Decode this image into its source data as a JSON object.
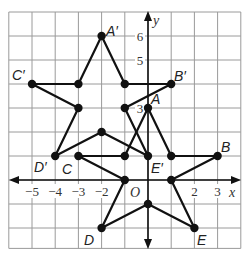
{
  "figure": {
    "grid": {
      "xmin": -6,
      "xmax": 4,
      "ymin": -2.85,
      "ymax": 7
    },
    "axes": {
      "x_label": "x",
      "y_label": "y",
      "origin_label": "O",
      "x_ticks": [
        {
          "value": -5,
          "label": "−5"
        },
        {
          "value": -4,
          "label": "−4"
        },
        {
          "value": -3,
          "label": "−3"
        },
        {
          "value": -2,
          "label": "−2"
        },
        {
          "value": 2,
          "label": "2"
        },
        {
          "value": 3,
          "label": "3"
        }
      ],
      "y_ticks": [
        {
          "value": 6,
          "label": "6"
        },
        {
          "value": 5,
          "label": "5"
        },
        {
          "value": 3,
          "label": "3"
        }
      ]
    },
    "original_star": {
      "name": "ABCDE",
      "vertices": [
        {
          "label": "A",
          "x": 0,
          "y": 3
        },
        {
          "label": "",
          "x": 1,
          "y": 1
        },
        {
          "label": "B",
          "x": 3,
          "y": 1
        },
        {
          "label": "",
          "x": 1,
          "y": 0
        },
        {
          "label": "E",
          "x": 2,
          "y": -2
        },
        {
          "label": "",
          "x": 0,
          "y": -1
        },
        {
          "label": "D",
          "x": -2,
          "y": -2
        },
        {
          "label": "",
          "x": -1,
          "y": 0
        },
        {
          "label": "C",
          "x": -3,
          "y": 1
        },
        {
          "label": "",
          "x": -1,
          "y": 1
        }
      ]
    },
    "image_star": {
      "name": "A'B'C'D'E'",
      "vertices": [
        {
          "label": "A′",
          "x": -2,
          "y": 6
        },
        {
          "label": "",
          "x": -1,
          "y": 4
        },
        {
          "label": "B′",
          "x": 1,
          "y": 4
        },
        {
          "label": "",
          "x": -1,
          "y": 3
        },
        {
          "label": "E′",
          "x": 0,
          "y": 1
        },
        {
          "label": "",
          "x": -2,
          "y": 2
        },
        {
          "label": "D′",
          "x": -4,
          "y": 1
        },
        {
          "label": "",
          "x": -3,
          "y": 3
        },
        {
          "label": "C′",
          "x": -5,
          "y": 4
        },
        {
          "label": "",
          "x": -3,
          "y": 4
        }
      ]
    },
    "labels": {
      "A": "A",
      "B": "B",
      "C": "C",
      "D": "D",
      "E": "E",
      "A_prime": "A′",
      "B_prime": "B′",
      "C_prime": "C′",
      "D_prime": "D′",
      "E_prime": "E′"
    }
  }
}
